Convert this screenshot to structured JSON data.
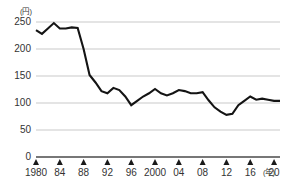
{
  "chart_data": {
    "type": "line",
    "title": "",
    "subtitle": "",
    "xlabel": "(年)",
    "ylabel": "(円)",
    "ylim": [
      0,
      250
    ],
    "xlim": [
      1980,
      2021
    ],
    "grid": true,
    "legend_position": "none",
    "y_ticks": [
      "0",
      "50",
      "100",
      "150",
      "200",
      "250"
    ],
    "y_tick_values": [
      0,
      50,
      100,
      150,
      200,
      250
    ],
    "x_ticks": [
      "1980",
      "84",
      "88",
      "92",
      "96",
      "2000",
      "04",
      "08",
      "12",
      "16",
      "20"
    ],
    "x_tick_values": [
      1980,
      1984,
      1988,
      1992,
      1996,
      2000,
      2004,
      2008,
      2012,
      2016,
      2020
    ],
    "series": [
      {
        "name": "",
        "color": "#141414",
        "x": [
          1980,
          1981,
          1982,
          1983,
          1984,
          1985,
          1986,
          1987,
          1988,
          1989,
          1990,
          1991,
          1992,
          1993,
          1994,
          1995,
          1996,
          1997,
          1998,
          1999,
          2000,
          2001,
          2002,
          2003,
          2004,
          2005,
          2006,
          2007,
          2008,
          2009,
          2010,
          2011,
          2012,
          2013,
          2014,
          2015,
          2016,
          2017,
          2018,
          2019,
          2020,
          2021
        ],
        "values": [
          235,
          228,
          238,
          248,
          238,
          238,
          240,
          239,
          200,
          152,
          138,
          122,
          118,
          128,
          124,
          112,
          96,
          104,
          112,
          118,
          126,
          118,
          114,
          118,
          124,
          122,
          118,
          118,
          120,
          105,
          92,
          84,
          78,
          80,
          96,
          104,
          112,
          106,
          108,
          106,
          104,
          104
        ]
      }
    ]
  }
}
